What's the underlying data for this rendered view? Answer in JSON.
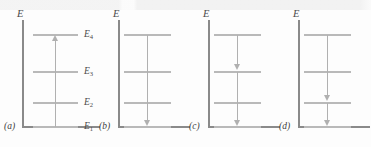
{
  "figure": {
    "axis_label": "E",
    "background_color": "#fdfdfd",
    "axis_color": "#8a8a8a",
    "level_color": "#b9b9b9",
    "arrow_color": "#b0b0b0"
  },
  "levels": [
    {
      "id": "E4",
      "label": "E",
      "sub": "4",
      "y": 35
    },
    {
      "id": "E3",
      "label": "E",
      "sub": "3",
      "y": 72
    },
    {
      "id": "E2",
      "label": "E",
      "sub": "2",
      "y": 103
    },
    {
      "id": "E1",
      "label": "E",
      "sub": "1",
      "y": 127
    }
  ],
  "panels": [
    {
      "caption": "(a)",
      "axis_label": "E",
      "show_level_labels": true,
      "transitions": [
        {
          "from": "E1",
          "to": "E4",
          "direction": "up"
        }
      ]
    },
    {
      "caption": "(b)",
      "axis_label": "E",
      "show_level_labels": false,
      "transitions": [
        {
          "from": "E4",
          "to": "E1",
          "direction": "down"
        }
      ]
    },
    {
      "caption": "(c)",
      "axis_label": "E",
      "show_level_labels": false,
      "transitions": [
        {
          "from": "E4",
          "to": "E3",
          "direction": "down"
        },
        {
          "from": "E3",
          "to": "E1",
          "direction": "down"
        }
      ]
    },
    {
      "caption": "(d)",
      "axis_label": "E",
      "show_level_labels": false,
      "transitions": [
        {
          "from": "E4",
          "to": "E2",
          "direction": "down"
        },
        {
          "from": "E2",
          "to": "E1",
          "direction": "down"
        }
      ]
    }
  ]
}
